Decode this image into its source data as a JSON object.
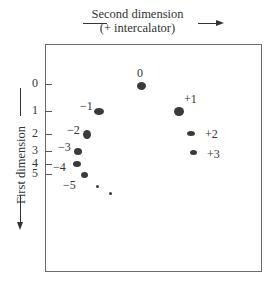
{
  "figure": {
    "top_axis": {
      "title": "Second dimension",
      "subtitle": "(+ intercalator)"
    },
    "side_axis": {
      "title": "First dimension"
    },
    "ticks": [
      {
        "label": "0",
        "y": 84
      },
      {
        "label": "1",
        "y": 111
      },
      {
        "label": "2",
        "y": 134
      },
      {
        "label": "3",
        "y": 151
      },
      {
        "label": "4",
        "y": 164
      },
      {
        "label": "5",
        "y": 174
      }
    ],
    "spots": [
      {
        "label": "0",
        "x": 141,
        "y": 86,
        "w": 9,
        "h": 8,
        "lx": 137,
        "ly": 66
      },
      {
        "label": "−1",
        "x": 99,
        "y": 111,
        "w": 10,
        "h": 7,
        "lx": 80,
        "ly": 99
      },
      {
        "label": "−2",
        "x": 87,
        "y": 134,
        "w": 8,
        "h": 9,
        "lx": 67,
        "ly": 123
      },
      {
        "label": "−3",
        "x": 78,
        "y": 151,
        "w": 8,
        "h": 7,
        "lx": 58,
        "ly": 140
      },
      {
        "label": "−4",
        "x": 77,
        "y": 164,
        "w": 8,
        "h": 6,
        "lx": 53,
        "ly": 160
      },
      {
        "label": "−5",
        "x": 84,
        "y": 175,
        "w": 7,
        "h": 6,
        "lx": 63,
        "ly": 178
      },
      {
        "label": "",
        "x": 97,
        "y": 186,
        "w": 3,
        "h": 3,
        "lx": 0,
        "ly": 0
      },
      {
        "label": "",
        "x": 110,
        "y": 193,
        "w": 3,
        "h": 3,
        "lx": 0,
        "ly": 0
      },
      {
        "label": "+1",
        "x": 179,
        "y": 111,
        "w": 10,
        "h": 9,
        "lx": 184,
        "ly": 92
      },
      {
        "label": "+2",
        "x": 191,
        "y": 133,
        "w": 8,
        "h": 5,
        "lx": 205,
        "ly": 127
      },
      {
        "label": "+3",
        "x": 193,
        "y": 152,
        "w": 7,
        "h": 5,
        "lx": 207,
        "ly": 147
      }
    ]
  }
}
